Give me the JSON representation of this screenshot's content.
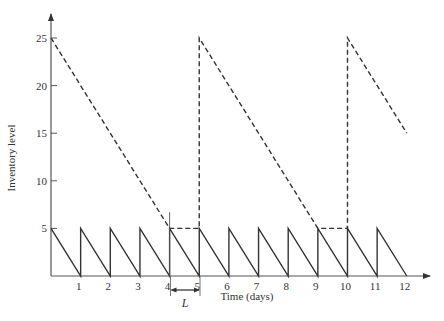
{
  "chart_data": {
    "type": "line",
    "title": "",
    "xlabel": "Time (days)",
    "ylabel": "Inventory level",
    "xlim": [
      0,
      12
    ],
    "ylim": [
      0,
      25
    ],
    "x_ticks": [
      1,
      2,
      3,
      4,
      5,
      6,
      7,
      8,
      9,
      10,
      11,
      12
    ],
    "y_ticks": [
      5,
      10,
      15,
      20,
      25
    ],
    "grid": false,
    "legend": null,
    "series": [
      {
        "name": "Daily replenishment inventory (sawtooth)",
        "style": "solid",
        "points": [
          [
            0,
            5
          ],
          [
            1,
            0
          ],
          [
            1,
            5
          ],
          [
            2,
            0
          ],
          [
            2,
            5
          ],
          [
            3,
            0
          ],
          [
            3,
            5
          ],
          [
            4,
            0
          ],
          [
            4,
            5
          ],
          [
            5,
            0
          ],
          [
            5,
            5
          ],
          [
            6,
            0
          ],
          [
            6,
            5
          ],
          [
            7,
            0
          ],
          [
            7,
            5
          ],
          [
            8,
            0
          ],
          [
            8,
            5
          ],
          [
            9,
            0
          ],
          [
            9,
            5
          ],
          [
            10,
            0
          ],
          [
            10,
            5
          ],
          [
            11,
            0
          ],
          [
            11,
            5
          ],
          [
            12,
            0
          ]
        ]
      },
      {
        "name": "Infrequent large-order inventory",
        "style": "dashed",
        "points": [
          [
            0,
            25
          ],
          [
            4,
            5
          ],
          [
            5,
            5
          ],
          [
            5,
            25
          ],
          [
            9,
            5
          ],
          [
            10,
            5
          ],
          [
            10,
            25
          ],
          [
            12,
            15
          ]
        ]
      }
    ],
    "annotations": [
      {
        "text": "L",
        "type": "lead-time bracket",
        "from_x": 4,
        "to_x": 5
      },
      {
        "type": "vertical marker",
        "x": 4,
        "y_from": 0,
        "y_to": 6.7
      }
    ]
  },
  "labels": {
    "lead_time": "L"
  }
}
